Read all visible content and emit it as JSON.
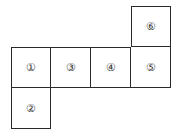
{
  "diagram": {
    "type": "cube-net",
    "cell_size_px": 40,
    "line_color": "#2a2a2a",
    "faces": [
      {
        "id": "face-1",
        "label": "①",
        "col": 0,
        "row": 1
      },
      {
        "id": "face-3",
        "label": "③",
        "col": 1,
        "row": 1
      },
      {
        "id": "face-4",
        "label": "④",
        "col": 2,
        "row": 1
      },
      {
        "id": "face-5",
        "label": "⑤",
        "col": 3,
        "row": 1
      },
      {
        "id": "face-6",
        "label": "⑥",
        "col": 3,
        "row": 0
      },
      {
        "id": "face-2",
        "label": "②",
        "col": 0,
        "row": 2
      }
    ]
  }
}
